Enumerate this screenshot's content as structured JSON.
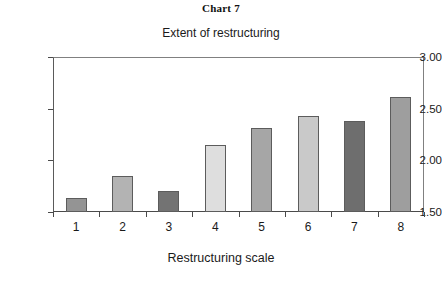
{
  "chart_data": {
    "type": "bar",
    "title": "Chart 7",
    "subtitle": "Extent of restructuring",
    "xlabel": "Restructuring scale",
    "ylabel": "",
    "categories": [
      "1",
      "2",
      "3",
      "4",
      "5",
      "6",
      "7",
      "8"
    ],
    "values": [
      1.64,
      1.85,
      1.7,
      2.15,
      2.31,
      2.43,
      2.38,
      2.61
    ],
    "ylim": [
      1.5,
      3.0
    ],
    "ytick_labels": [
      "3.00",
      "2.50",
      "2.00",
      "1.50"
    ],
    "ytick_values": [
      3.0,
      2.5,
      2.0,
      1.5
    ],
    "grid": false,
    "legend": "none",
    "bar_colors": [
      "#949494",
      "#b3b3b3",
      "#737373",
      "#dedede",
      "#a6a6a6",
      "#c9c9c9",
      "#6e6e6e",
      "#9e9e9e"
    ],
    "bar_border_color": "#5c5c5c",
    "axis_color": "#4a4a4a",
    "background": "#ffffff"
  }
}
